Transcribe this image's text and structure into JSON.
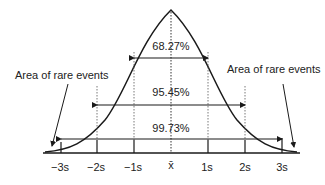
{
  "diagram": {
    "annotations": {
      "left_rare": "Area of rare events",
      "right_rare": "Area of rare events"
    },
    "intervals": [
      {
        "label": "68.27%",
        "range": "±1s"
      },
      {
        "label": "95.45%",
        "range": "±2s"
      },
      {
        "label": "99.73%",
        "range": "±3s"
      }
    ],
    "axis_ticks": [
      "−3s",
      "−2s",
      "−1s",
      "x̄",
      "1s",
      "2s",
      "3s"
    ],
    "colors": {
      "line": "#1a1a1a",
      "text": "#222222",
      "background": "#ffffff"
    }
  }
}
